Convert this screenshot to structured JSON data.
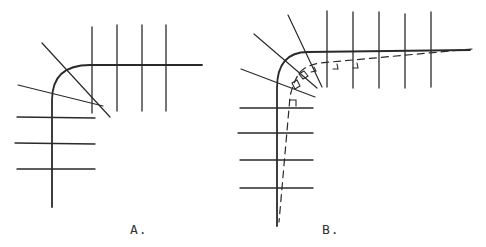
{
  "figure": {
    "panels": [
      {
        "id": "A",
        "label": "A.",
        "description": "Rounded corner of a curb/contour line with perpendicular tick lines on the straight segments and two diagonal lines crossing near the curve"
      },
      {
        "id": "B",
        "label": "B.",
        "description": "Rounded corner with perpendicular tick lines, radial lines normal to the curve, and a dashed offset line with right-angle markers"
      }
    ],
    "colors": {
      "line": "#2a2a2a",
      "background": "#ffffff"
    }
  }
}
